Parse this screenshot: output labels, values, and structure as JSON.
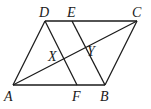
{
  "diagram": {
    "type": "parallelogram",
    "points": {
      "A": {
        "x": 13,
        "y": 85
      },
      "B": {
        "x": 105,
        "y": 85
      },
      "C": {
        "x": 137,
        "y": 21
      },
      "D": {
        "x": 45,
        "y": 21
      },
      "E": {
        "x": 72,
        "y": 21
      },
      "F": {
        "x": 77,
        "y": 85
      }
    },
    "segments": [
      [
        "A",
        "B"
      ],
      [
        "B",
        "C"
      ],
      [
        "C",
        "D"
      ],
      [
        "D",
        "A"
      ],
      [
        "D",
        "F"
      ],
      [
        "E",
        "B"
      ],
      [
        "A",
        "C"
      ]
    ],
    "labels": [
      {
        "text": "D",
        "x": 39,
        "y": 17
      },
      {
        "text": "E",
        "x": 67,
        "y": 17
      },
      {
        "text": "C",
        "x": 132,
        "y": 17
      },
      {
        "text": "X",
        "x": 48,
        "y": 61
      },
      {
        "text": "Y",
        "x": 87,
        "y": 56
      },
      {
        "text": "A",
        "x": 4,
        "y": 101
      },
      {
        "text": "F",
        "x": 72,
        "y": 101
      },
      {
        "text": "B",
        "x": 100,
        "y": 101
      }
    ]
  }
}
